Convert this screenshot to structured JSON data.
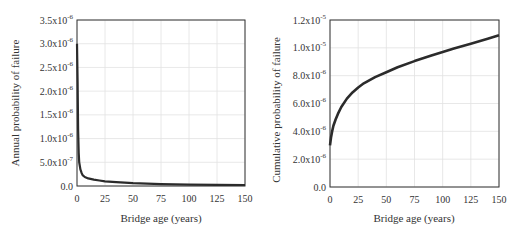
{
  "chart_data": [
    {
      "type": "line",
      "title": "",
      "xlabel": "Bridge age (years)",
      "ylabel": "Annual probability of failure",
      "xlim": [
        0,
        150
      ],
      "ylim": [
        0,
        3.5e-06
      ],
      "grid": true,
      "x_ticks": [
        0,
        25,
        50,
        75,
        100,
        125,
        150
      ],
      "y_ticks": [
        {
          "value": 0,
          "label": "0.0",
          "exp": ""
        },
        {
          "value": 5e-07,
          "label": "5.0x10",
          "exp": "-7"
        },
        {
          "value": 1e-06,
          "label": "1.0x10",
          "exp": "-6"
        },
        {
          "value": 1.5e-06,
          "label": "1.5x10",
          "exp": "-6"
        },
        {
          "value": 2e-06,
          "label": "2.0x10",
          "exp": "-6"
        },
        {
          "value": 2.5e-06,
          "label": "2.5x10",
          "exp": "-6"
        },
        {
          "value": 3e-06,
          "label": "3.0x10",
          "exp": "-6"
        },
        {
          "value": 3.5e-06,
          "label": "3.5x10",
          "exp": "-6"
        }
      ],
      "series": [
        {
          "name": "Annual probability of failure",
          "x": [
            0,
            0.5,
            1,
            1.5,
            2,
            3,
            4,
            5,
            7,
            10,
            15,
            20,
            25,
            35,
            50,
            75,
            100,
            125,
            150
          ],
          "values": [
            3e-06,
            2.2e-06,
            1.2e-06,
            7e-07,
            5e-07,
            3.5e-07,
            2.8e-07,
            2.3e-07,
            1.9e-07,
            1.6e-07,
            1.35e-07,
            1.15e-07,
            1e-07,
            8e-08,
            6e-08,
            4e-08,
            3e-08,
            2.5e-08,
            2.2e-08
          ]
        }
      ]
    },
    {
      "type": "line",
      "title": "",
      "xlabel": "Bridge age (years)",
      "ylabel": "Cumulative probability of failure",
      "xlim": [
        0,
        150
      ],
      "ylim": [
        0,
        1.2e-05
      ],
      "grid": true,
      "x_ticks": [
        0,
        25,
        50,
        75,
        100,
        125,
        150
      ],
      "y_ticks": [
        {
          "value": 0,
          "label": "0.0",
          "exp": ""
        },
        {
          "value": 2e-06,
          "label": "2.0x10",
          "exp": "-6"
        },
        {
          "value": 4e-06,
          "label": "4.0x10",
          "exp": "-6"
        },
        {
          "value": 6e-06,
          "label": "6.0x10",
          "exp": "-6"
        },
        {
          "value": 8e-06,
          "label": "8.0x10",
          "exp": "-6"
        },
        {
          "value": 1e-05,
          "label": "1.0x10",
          "exp": "-5"
        },
        {
          "value": 1.2e-05,
          "label": "1.2x10",
          "exp": "-5"
        }
      ],
      "series": [
        {
          "name": "Cumulative probability of failure",
          "x": [
            0,
            1,
            2,
            3,
            5,
            7,
            10,
            15,
            20,
            25,
            30,
            40,
            50,
            60,
            75,
            90,
            100,
            110,
            125,
            140,
            150
          ],
          "values": [
            3e-06,
            3.6e-06,
            4.05e-06,
            4.4e-06,
            4.85e-06,
            5.25e-06,
            5.75e-06,
            6.35e-06,
            6.8e-06,
            7.15e-06,
            7.45e-06,
            7.9e-06,
            8.25e-06,
            8.6e-06,
            9.05e-06,
            9.45e-06,
            9.7e-06,
            9.95e-06,
            1.03e-05,
            1.065e-05,
            1.09e-05
          ]
        }
      ]
    }
  ]
}
